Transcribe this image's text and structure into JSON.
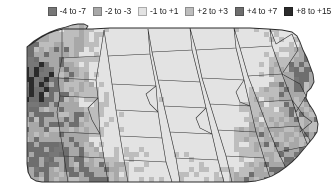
{
  "figure": {
    "width": 331,
    "height": 190,
    "background": "#ffffff"
  },
  "legend": {
    "name": "map-legend",
    "position": "top",
    "background": "#ffffff",
    "items": [
      {
        "label": "-4 to -7",
        "color": "#777777",
        "min": -7,
        "max": -4
      },
      {
        "label": "-2 to -3",
        "color": "#a8a8a8",
        "min": -3,
        "max": -2
      },
      {
        "label": "-1 to +1",
        "color": "#e3e3e3",
        "min": -1,
        "max": 1
      },
      {
        "label": "+2 to +3",
        "color": "#bdbdbd",
        "min": 2,
        "max": 3
      },
      {
        "label": "+4 to +7",
        "color": "#6e6e6e",
        "min": 4,
        "max": 7
      },
      {
        "label": "+8 to +15",
        "color": "#2b2b2b",
        "min": 8,
        "max": 15
      }
    ]
  },
  "chart_data": {
    "type": "heatmap",
    "title": "",
    "xlabel": "",
    "ylabel": "",
    "grid": false,
    "legend_position": "top",
    "colorscale": [
      "#777777",
      "#a8a8a8",
      "#e3e3e3",
      "#bdbdbd",
      "#6e6e6e",
      "#2b2b2b"
    ],
    "class_labels": [
      "-4 to -7",
      "-2 to -3",
      "-1 to +1",
      "+2 to +3",
      "+4 to +7",
      "+8 to +15"
    ],
    "class_values": [
      -5.5,
      -2.5,
      0,
      2.5,
      5.5,
      11.5
    ],
    "cell_size_px": 5,
    "region": "Pennsylvania",
    "boundaries": "county",
    "boundary_color": "#2a2a2a",
    "region_notes": [
      {
        "area": "northwest",
        "dominant_class": "+4 to +7"
      },
      {
        "area": "west",
        "dominant_class": "+2 to +3"
      },
      {
        "area": "north-central",
        "dominant_class": "-1 to +1"
      },
      {
        "area": "central",
        "dominant_class": "-1 to +1"
      },
      {
        "area": "northeast",
        "dominant_class": "+4 to +7"
      },
      {
        "area": "southeast",
        "dominant_class": "+8 to +15"
      },
      {
        "area": "southwest",
        "dominant_class": "+2 to +3"
      }
    ]
  },
  "map": {
    "name": "pennsylvania-choropleth",
    "outline_color": "#2a2a2a",
    "counties_visible": true,
    "raster_visible": true
  }
}
